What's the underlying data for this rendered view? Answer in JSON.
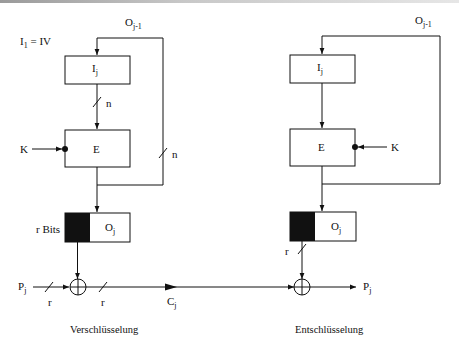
{
  "diagram": {
    "type": "block-diagram",
    "colors": {
      "line": "#111111",
      "fill_black": "#111111",
      "background": "#ffffff"
    },
    "encryption": {
      "caption": "Verschlüsselung",
      "init_label": {
        "base": "I",
        "sub": "1",
        "rest": " = IV"
      },
      "feedback_label": {
        "base": "O",
        "sub": "j-1"
      },
      "input_register": {
        "base": "I",
        "sub": "j"
      },
      "cipher_block": "E",
      "key": "K",
      "bus_width_n_1": "n",
      "bus_width_n_2": "n",
      "output_register": {
        "base": "O",
        "sub": "j"
      },
      "output_select_label": "r Bits",
      "plaintext": {
        "base": "P",
        "sub": "j"
      },
      "plaintext_width": "r",
      "xor_out_width": "r",
      "ciphertext": {
        "base": "C",
        "sub": "j"
      }
    },
    "decryption": {
      "caption": "Entschlüsselung",
      "feedback_label": {
        "base": "O",
        "sub": "j-1"
      },
      "input_register": {
        "base": "I",
        "sub": "j"
      },
      "cipher_block": "E",
      "key": "K",
      "output_register": {
        "base": "O",
        "sub": "j"
      },
      "output_select_width": "r",
      "plaintext_out": {
        "base": "P",
        "sub": "j"
      }
    }
  }
}
